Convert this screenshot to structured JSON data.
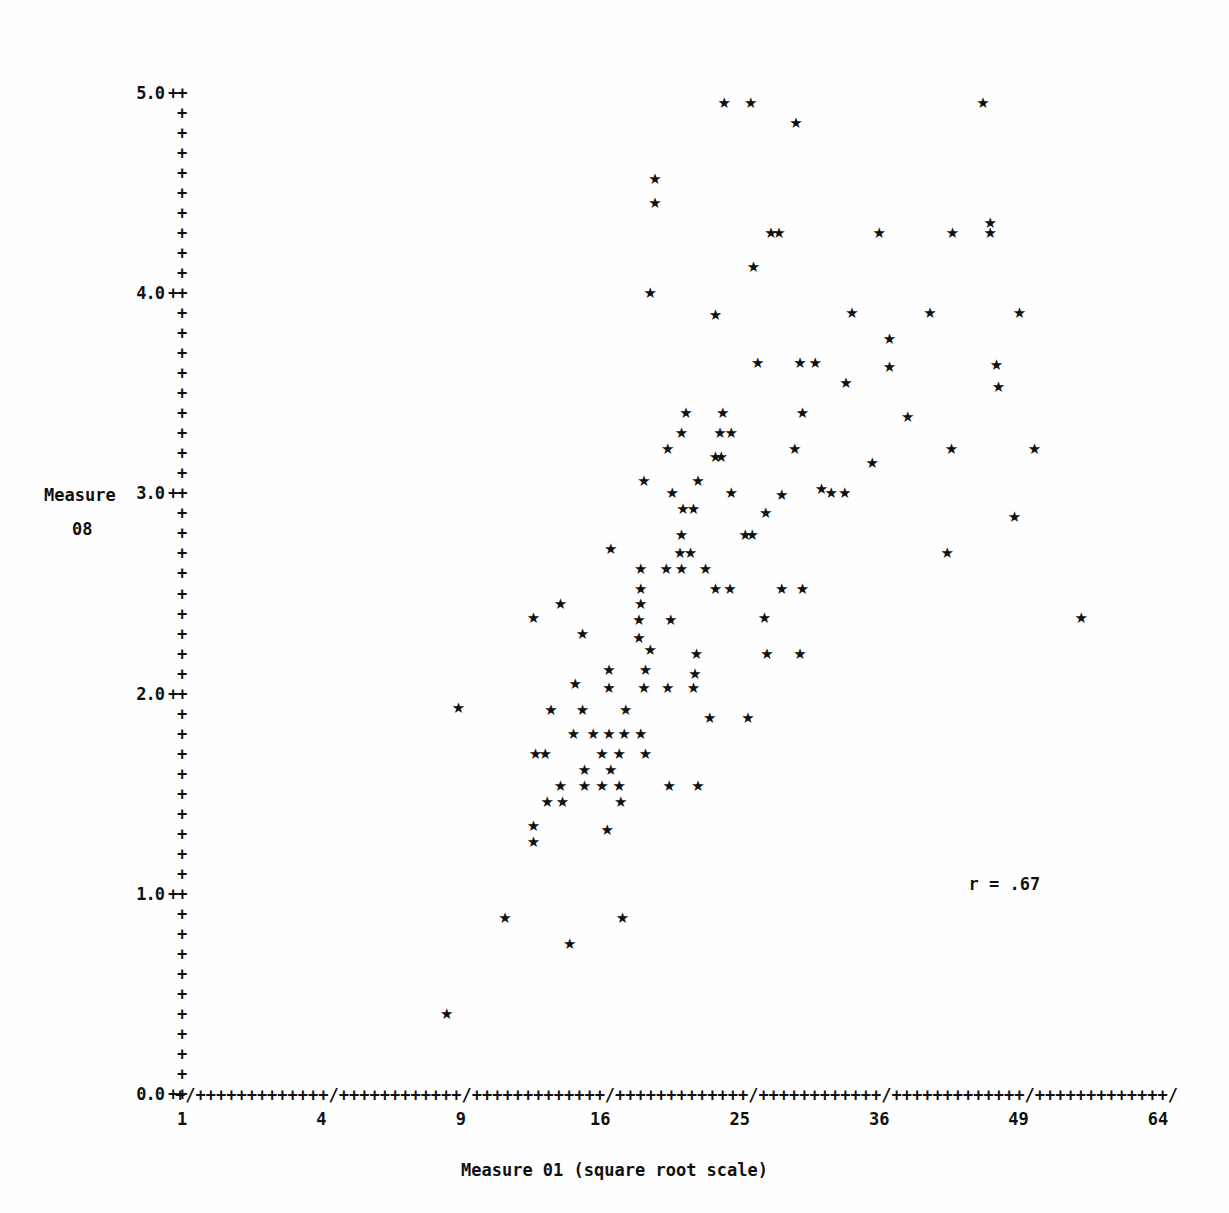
{
  "chart_data": {
    "type": "scatter",
    "title": "",
    "xlabel": "Measure 01 (square root scale)",
    "ylabel": "Measure 08",
    "ylabel_lines": [
      "Measure",
      "08"
    ],
    "x_scale": "sqrt",
    "y_scale": "linear",
    "xlim": [
      1,
      64
    ],
    "ylim": [
      0.0,
      5.0
    ],
    "x_ticks": [
      1,
      4,
      9,
      16,
      25,
      36,
      49,
      64
    ],
    "x_tick_labels": [
      "1",
      "4",
      "9",
      "16",
      "25",
      "36",
      "49",
      "64"
    ],
    "y_ticks": [
      0.0,
      1.0,
      2.0,
      3.0,
      4.0,
      5.0
    ],
    "y_tick_labels": [
      "0.0",
      "1.0",
      "2.0",
      "3.0",
      "4.0",
      "5.0"
    ],
    "y_minor_ticks_per_unit": 10,
    "grid": false,
    "legend": null,
    "axis_tick_glyph": "+",
    "axis_major_glyph": "/",
    "marker_glyph": "*",
    "marker_color": "#111111",
    "annotations": [
      {
        "text": "r = .67",
        "x_value": 48,
        "y_value": 1.05,
        "name": "correlation-annotation"
      }
    ],
    "n_points": 138,
    "points": [
      [
        23.9,
        4.95
      ],
      [
        25.8,
        4.95
      ],
      [
        45.5,
        4.95
      ],
      [
        29.2,
        4.85
      ],
      [
        19.3,
        4.57
      ],
      [
        19.3,
        4.45
      ],
      [
        27.3,
        4.3
      ],
      [
        27.9,
        4.3
      ],
      [
        36.0,
        4.3
      ],
      [
        42.6,
        4.3
      ],
      [
        46.2,
        4.35
      ],
      [
        46.2,
        4.3
      ],
      [
        26.0,
        4.13
      ],
      [
        19.0,
        4.0
      ],
      [
        23.3,
        3.89
      ],
      [
        33.7,
        3.9
      ],
      [
        40.5,
        3.9
      ],
      [
        49.1,
        3.9
      ],
      [
        36.9,
        3.77
      ],
      [
        26.3,
        3.65
      ],
      [
        29.5,
        3.65
      ],
      [
        30.7,
        3.65
      ],
      [
        36.9,
        3.63
      ],
      [
        46.8,
        3.64
      ],
      [
        33.2,
        3.55
      ],
      [
        47.0,
        3.53
      ],
      [
        21.3,
        3.4
      ],
      [
        23.8,
        3.4
      ],
      [
        29.7,
        3.4
      ],
      [
        38.5,
        3.38
      ],
      [
        21.0,
        3.3
      ],
      [
        23.6,
        3.3
      ],
      [
        24.4,
        3.3
      ],
      [
        20.1,
        3.22
      ],
      [
        29.1,
        3.22
      ],
      [
        42.5,
        3.22
      ],
      [
        50.6,
        3.22
      ],
      [
        23.3,
        3.18
      ],
      [
        23.7,
        3.18
      ],
      [
        35.4,
        3.15
      ],
      [
        18.6,
        3.06
      ],
      [
        22.1,
        3.06
      ],
      [
        31.2,
        3.02
      ],
      [
        20.4,
        3.0
      ],
      [
        24.4,
        3.0
      ],
      [
        28.1,
        2.99
      ],
      [
        32.0,
        3.0
      ],
      [
        33.1,
        3.0
      ],
      [
        21.1,
        2.92
      ],
      [
        21.8,
        2.92
      ],
      [
        26.9,
        2.9
      ],
      [
        48.6,
        2.88
      ],
      [
        21.0,
        2.79
      ],
      [
        25.4,
        2.79
      ],
      [
        25.9,
        2.79
      ],
      [
        16.6,
        2.72
      ],
      [
        20.9,
        2.7
      ],
      [
        21.6,
        2.7
      ],
      [
        42.1,
        2.7
      ],
      [
        18.4,
        2.62
      ],
      [
        20.0,
        2.62
      ],
      [
        21.0,
        2.62
      ],
      [
        22.6,
        2.62
      ],
      [
        18.4,
        2.52
      ],
      [
        23.3,
        2.52
      ],
      [
        24.3,
        2.52
      ],
      [
        28.1,
        2.52
      ],
      [
        29.7,
        2.52
      ],
      [
        13.8,
        2.45
      ],
      [
        18.4,
        2.45
      ],
      [
        12.4,
        2.38
      ],
      [
        18.3,
        2.37
      ],
      [
        20.3,
        2.37
      ],
      [
        26.8,
        2.38
      ],
      [
        55.5,
        2.38
      ],
      [
        15.0,
        2.3
      ],
      [
        18.3,
        2.28
      ],
      [
        19.0,
        2.22
      ],
      [
        22.0,
        2.2
      ],
      [
        27.0,
        2.2
      ],
      [
        29.5,
        2.2
      ],
      [
        16.5,
        2.12
      ],
      [
        18.7,
        2.12
      ],
      [
        21.9,
        2.1
      ],
      [
        14.6,
        2.05
      ],
      [
        16.5,
        2.03
      ],
      [
        18.6,
        2.03
      ],
      [
        20.1,
        2.03
      ],
      [
        21.8,
        2.03
      ],
      [
        13.3,
        1.92
      ],
      [
        15.0,
        1.92
      ],
      [
        17.5,
        1.92
      ],
      [
        22.9,
        1.88
      ],
      [
        25.6,
        1.88
      ],
      [
        8.9,
        1.93
      ],
      [
        14.5,
        1.8
      ],
      [
        15.6,
        1.8
      ],
      [
        16.5,
        1.8
      ],
      [
        17.4,
        1.8
      ],
      [
        18.4,
        1.8
      ],
      [
        12.5,
        1.7
      ],
      [
        13.0,
        1.7
      ],
      [
        16.1,
        1.7
      ],
      [
        17.1,
        1.7
      ],
      [
        18.7,
        1.7
      ],
      [
        15.1,
        1.62
      ],
      [
        16.6,
        1.62
      ],
      [
        13.8,
        1.54
      ],
      [
        15.1,
        1.54
      ],
      [
        16.1,
        1.54
      ],
      [
        17.1,
        1.54
      ],
      [
        20.2,
        1.54
      ],
      [
        22.1,
        1.54
      ],
      [
        13.1,
        1.46
      ],
      [
        13.9,
        1.46
      ],
      [
        17.2,
        1.46
      ],
      [
        12.4,
        1.34
      ],
      [
        12.4,
        1.26
      ],
      [
        16.4,
        1.32
      ],
      [
        11.0,
        0.88
      ],
      [
        17.3,
        0.88
      ],
      [
        14.3,
        0.75
      ],
      [
        8.4,
        0.4
      ]
    ],
    "scatter_notes": "138 star-glyph markers; positive association between Measure 01 (sqrt axis) and Measure 08."
  },
  "axes": {
    "y_label_suffix": "++",
    "y_minor_glyph": "+"
  }
}
